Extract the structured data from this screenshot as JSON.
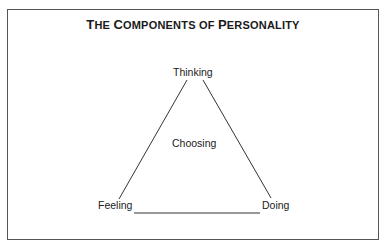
{
  "title": {
    "parts": [
      {
        "cap": "T",
        "rest": "HE "
      },
      {
        "cap": "C",
        "rest": "OMPONENTS OF "
      },
      {
        "cap": "P",
        "rest": "ERSONALITY"
      }
    ],
    "full": "The Components of Personality"
  },
  "diagram": {
    "type": "triangle",
    "vertices": {
      "top": "Thinking",
      "bottom_left": "Feeling",
      "bottom_right": "Doing"
    },
    "center": "Choosing"
  },
  "colors": {
    "line": "#333333",
    "border": "#555555",
    "text": "#1a1a1a"
  }
}
